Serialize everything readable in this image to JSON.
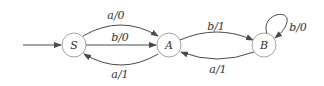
{
  "diagram": {
    "type": "finite-state-machine",
    "nodes": [
      {
        "id": "S",
        "label": "S",
        "initial": true
      },
      {
        "id": "A",
        "label": "A"
      },
      {
        "id": "B",
        "label": "B"
      }
    ],
    "edges": [
      {
        "from": "S",
        "to": "A",
        "label": "a/0",
        "position": "upper"
      },
      {
        "from": "S",
        "to": "A",
        "label": "b/0",
        "position": "middle"
      },
      {
        "from": "A",
        "to": "S",
        "label": "a/1",
        "position": "lower"
      },
      {
        "from": "A",
        "to": "B",
        "label": "b/1",
        "position": "upper"
      },
      {
        "from": "B",
        "to": "A",
        "label": "a/1",
        "position": "lower"
      },
      {
        "from": "B",
        "to": "B",
        "label": "b/0",
        "position": "self-loop"
      }
    ],
    "colors": {
      "node_stroke": "#8a8a8a",
      "edge": "#4a4a4a",
      "text": "#333333",
      "background": "#ffffff"
    }
  }
}
